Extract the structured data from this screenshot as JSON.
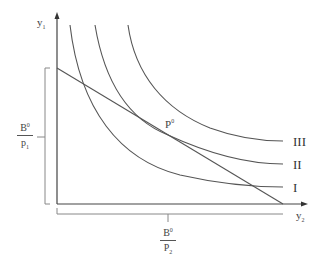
{
  "diagram": {
    "type": "indifference-curve-budget-diagram",
    "axes": {
      "y_axis_label": {
        "base": "y",
        "sub": "1"
      },
      "x_axis_label": {
        "base": "y",
        "sub": "2"
      }
    },
    "intercepts": {
      "vertical": {
        "num_base": "B",
        "num_sup": "0",
        "den_base": "p",
        "den_sub": "1"
      },
      "horizontal": {
        "num_base": "B",
        "num_sup": "0",
        "den_base": "P",
        "den_sub": "2"
      }
    },
    "tangency_point": {
      "base": "P",
      "sup": "0"
    },
    "indifference_curves": [
      {
        "label": "I"
      },
      {
        "label": "II"
      },
      {
        "label": "III"
      }
    ],
    "colors": {
      "line": "#555555",
      "bracket": "#888888",
      "background": "#ffffff"
    }
  }
}
